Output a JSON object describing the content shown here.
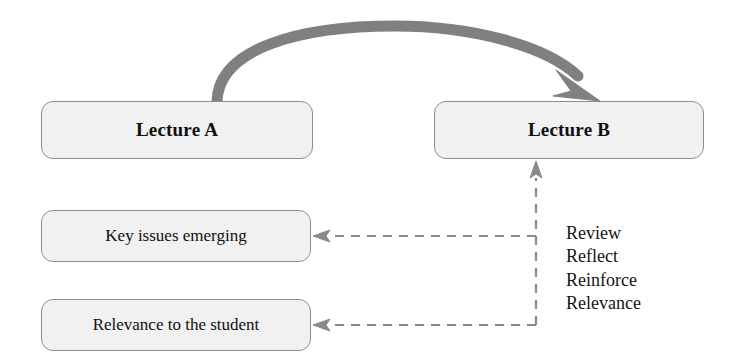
{
  "diagram": {
    "nodes": [
      {
        "id": "lecture_a",
        "label": "Lecture A"
      },
      {
        "id": "lecture_b",
        "label": "Lecture B"
      },
      {
        "id": "key_issues",
        "label": "Key issues emerging"
      },
      {
        "id": "relevance",
        "label": "Relevance to the student"
      }
    ],
    "action_list": {
      "items": [
        "Review",
        "Reflect",
        "Reinforce",
        "Relevance"
      ]
    },
    "connectors": [
      {
        "id": "curved_arrow",
        "from": "lecture_a",
        "to": "lecture_b",
        "style": "solid-curved",
        "color": "#808080"
      },
      {
        "id": "feedback_up",
        "from": "junction",
        "to": "lecture_b",
        "style": "dashed",
        "color": "#8a8a8a"
      },
      {
        "id": "feedback_key",
        "from": "junction",
        "to": "key_issues",
        "style": "dashed",
        "color": "#8a8a8a"
      },
      {
        "id": "feedback_relev",
        "from": "junction",
        "to": "relevance",
        "style": "dashed",
        "color": "#8a8a8a"
      }
    ],
    "colors": {
      "box_fill": "#f1f1f1",
      "box_border": "#8d8d8d",
      "arrow_gray": "#808080",
      "dashed_gray": "#8a8a8a",
      "text": "#101010",
      "background": "#ffffff"
    }
  }
}
